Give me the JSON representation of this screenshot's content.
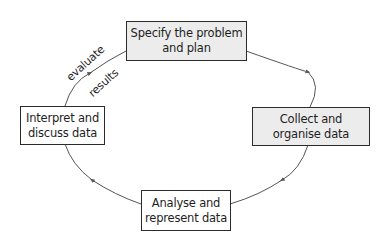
{
  "diagram": {
    "type": "cycle",
    "stages": [
      {
        "id": "specify",
        "lines": [
          "Specify the problem",
          "and plan"
        ],
        "fill": "#ececec"
      },
      {
        "id": "collect",
        "lines": [
          "Collect and",
          "organise data"
        ],
        "fill": "#ececec"
      },
      {
        "id": "analyse",
        "lines": [
          "Analyse and",
          "represent data"
        ],
        "fill": "#ffffff"
      },
      {
        "id": "interpret",
        "lines": [
          "Interpret and",
          "discuss data"
        ],
        "fill": "#ffffff"
      }
    ],
    "arrow_label": {
      "line1": "evaluate",
      "line2": "results"
    },
    "flow": [
      "specify",
      "collect",
      "analyse",
      "interpret",
      "specify"
    ],
    "colors": {
      "border": "#2b2b2b",
      "arrow": "#555555",
      "shaded_fill": "#ececec"
    }
  }
}
